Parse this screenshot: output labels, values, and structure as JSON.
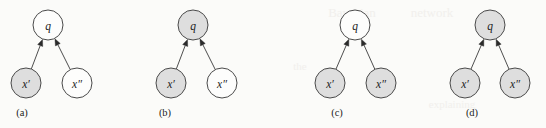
{
  "figure": {
    "width": 546,
    "height": 128,
    "background_color": "#fbfbf9",
    "node_shaded_color": "#dedede",
    "node_unshaded_color": "#fdfdfc",
    "node_stroke_color": "#4a4a4a",
    "edge_color": "#3a3a3a",
    "text_color": "#1d1d1d",
    "node_radius": 15,
    "parent_node_y": 25,
    "child_node_y": 83,
    "caption_y": 112
  },
  "background_bleed": [
    {
      "text": "Bayesian",
      "x": 352,
      "y": 12,
      "size": 13
    },
    {
      "text": "network",
      "x": 432,
      "y": 12,
      "size": 13
    },
    {
      "text": "the",
      "x": 300,
      "y": 66,
      "size": 11
    },
    {
      "text": "explaining",
      "x": 452,
      "y": 104,
      "size": 11
    }
  ],
  "panels": [
    {
      "id": "a",
      "caption": "(a)",
      "caption_x": 22,
      "parent": {
        "label": "q",
        "x": 48,
        "shaded": false,
        "state": "unobserved"
      },
      "children": [
        {
          "label": "x′",
          "x": 26,
          "shaded": true,
          "state": "observed"
        },
        {
          "label": "x″",
          "x": 77,
          "shaded": false,
          "state": "unobserved"
        }
      ]
    },
    {
      "id": "b",
      "caption": "(b)",
      "caption_x": 165,
      "parent": {
        "label": "q",
        "x": 193,
        "shaded": true,
        "state": "observed"
      },
      "children": [
        {
          "label": "x′",
          "x": 171,
          "shaded": true,
          "state": "observed"
        },
        {
          "label": "x″",
          "x": 222,
          "shaded": false,
          "state": "unobserved"
        }
      ]
    },
    {
      "id": "c",
      "caption": "(c)",
      "caption_x": 337,
      "parent": {
        "label": "q",
        "x": 355,
        "shaded": false,
        "state": "unobserved"
      },
      "children": [
        {
          "label": "x′",
          "x": 330,
          "shaded": true,
          "state": "observed"
        },
        {
          "label": "x″",
          "x": 381,
          "shaded": true,
          "state": "observed"
        }
      ]
    },
    {
      "id": "d",
      "caption": "(d)",
      "caption_x": 472,
      "parent": {
        "label": "q",
        "x": 490,
        "shaded": true,
        "state": "observed"
      },
      "children": [
        {
          "label": "x′",
          "x": 465,
          "shaded": true,
          "state": "observed"
        },
        {
          "label": "x″",
          "x": 515,
          "shaded": true,
          "state": "observed"
        }
      ]
    }
  ]
}
